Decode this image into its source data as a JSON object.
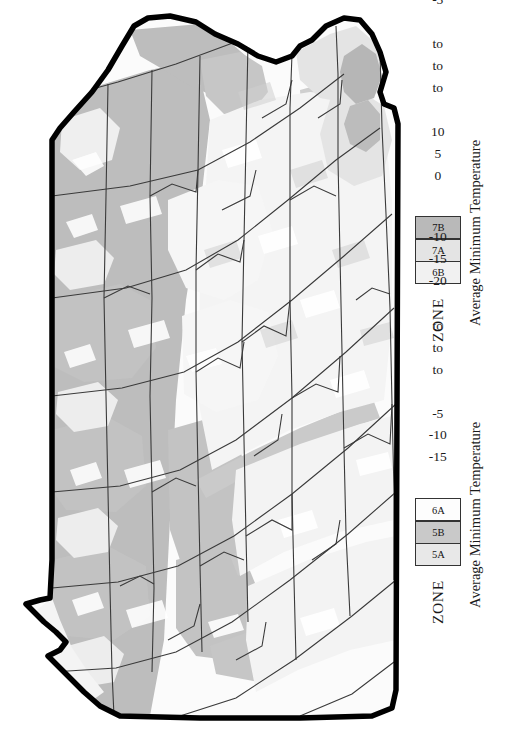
{
  "document": {
    "kind": "usda-plant-hardiness-zone-map",
    "orientation": "rotated-90-ccw",
    "background": "#ffffff"
  },
  "map": {
    "name": "pennsylvania-hardiness-zone-map",
    "outline_color": "#000000",
    "county_border_color": "#3a3a3a",
    "fills": {
      "zone_5a": "#bdbdbd",
      "zone_5b": "#d0d0d0",
      "zone_6a": "#fbfbfb",
      "zone_6b": "#f1f1f1",
      "zone_7a": "#e4e4e4",
      "zone_7b": "#b9b9b9"
    }
  },
  "legends": [
    {
      "id": "legend-warm",
      "zone_header": "ZONE",
      "temp_header": "Average Minimum Temperature",
      "rows": [
        {
          "zone_number": "6",
          "zone_letter": "B",
          "zone": "6B",
          "high": "0",
          "connector": "to",
          "low": "-5",
          "swatch": "#f1f1f1"
        },
        {
          "zone_number": "7",
          "zone_letter": "A",
          "zone": "7A",
          "high": "5",
          "connector": "to",
          "low": "0",
          "swatch": "#e4e4e4"
        },
        {
          "zone_number": "7",
          "zone_letter": "B",
          "zone": "7B",
          "high": "10",
          "connector": "to",
          "low": "5",
          "swatch": "#b9b9b9"
        }
      ]
    },
    {
      "id": "legend-cold",
      "zone_header": "ZONE",
      "temp_header": "Average Minimum Temperature",
      "rows": [
        {
          "zone_number": "5",
          "zone_letter": "A",
          "zone": "5A",
          "high": "-15",
          "connector": "to",
          "low": "-20",
          "swatch": "#e8e8e8"
        },
        {
          "zone_number": "5",
          "zone_letter": "B",
          "zone": "5B",
          "high": "-10",
          "connector": "to",
          "low": "-15",
          "swatch": "#c9c9c9"
        },
        {
          "zone_number": "6",
          "zone_letter": "A",
          "zone": "6A",
          "high": "-5",
          "connector": "to",
          "low": "-10",
          "swatch": "#fdfdfd"
        }
      ]
    }
  ]
}
